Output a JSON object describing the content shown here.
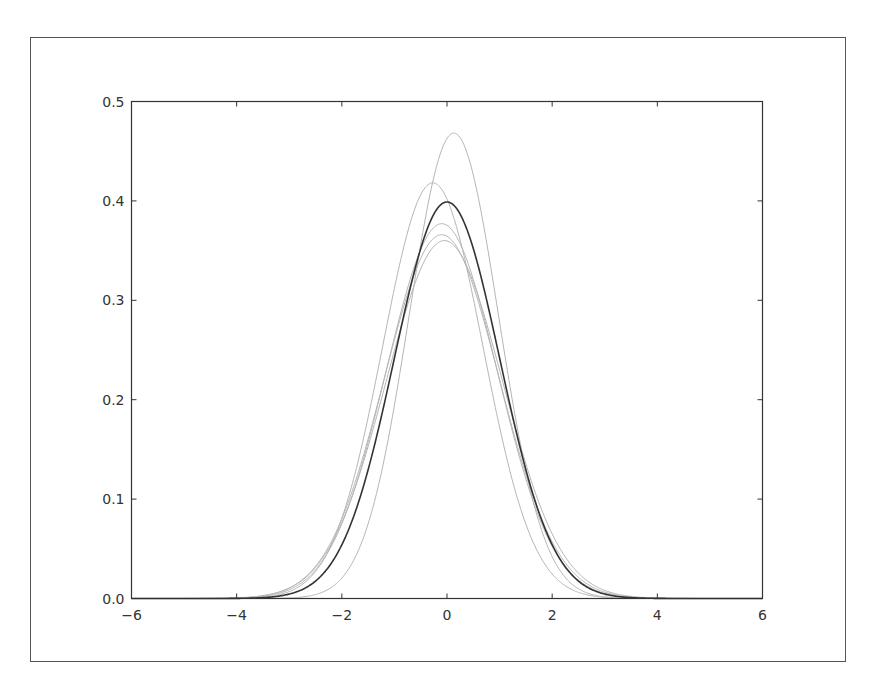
{
  "chart_data": {
    "type": "line",
    "title": "",
    "xlabel": "",
    "ylabel": "",
    "xlim": [
      -6,
      6
    ],
    "ylim": [
      0.0,
      0.5
    ],
    "x_ticks": [
      "-6",
      "-4",
      "-2",
      "0",
      "2",
      "4",
      "6"
    ],
    "y_ticks": [
      "0.0",
      "0.1",
      "0.2",
      "0.3",
      "0.4",
      "0.5"
    ],
    "grid": false,
    "legend": null,
    "series": [
      {
        "name": "standard-normal",
        "color": "#333333",
        "width": 1.6,
        "mean": 0.0,
        "sd": 1.0,
        "peak_x": 0.0,
        "peak_y": 0.399
      },
      {
        "name": "estimate-1",
        "color": "#b5b5b5",
        "width": 1.0,
        "mean": 0.13,
        "sd": 0.852,
        "peak_x": 0.13,
        "peak_y": 0.468
      },
      {
        "name": "estimate-2",
        "color": "#b5b5b5",
        "width": 1.0,
        "mean": -0.27,
        "sd": 0.954,
        "peak_x": -0.27,
        "peak_y": 0.418
      },
      {
        "name": "estimate-3",
        "color": "#b5b5b5",
        "width": 1.0,
        "mean": -0.1,
        "sd": 1.058,
        "peak_x": -0.1,
        "peak_y": 0.377
      },
      {
        "name": "estimate-4",
        "color": "#b5b5b5",
        "width": 1.0,
        "mean": -0.1,
        "sd": 1.09,
        "peak_x": -0.1,
        "peak_y": 0.366
      },
      {
        "name": "estimate-5",
        "color": "#b5b5b5",
        "width": 1.0,
        "mean": -0.05,
        "sd": 1.108,
        "peak_x": -0.05,
        "peak_y": 0.36
      }
    ]
  },
  "frame": {
    "border_color": "#555555",
    "axis_color": "#333333"
  }
}
